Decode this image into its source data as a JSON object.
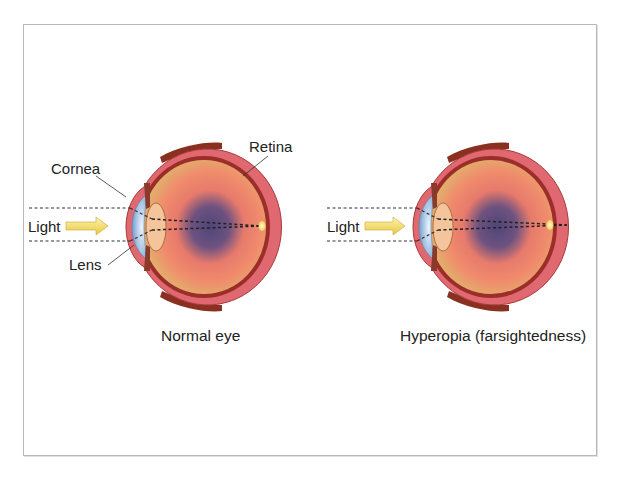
{
  "diagrams": [
    {
      "id": "normal",
      "caption": "Normal eye",
      "labels": {
        "light": "Light",
        "cornea": "Cornea",
        "lens": "Lens",
        "retina": "Retina"
      },
      "focus": "on retina"
    },
    {
      "id": "hyperopia",
      "caption": "Hyperopia (farsightedness)",
      "labels": {
        "light": "Light"
      },
      "focus": "behind retina"
    }
  ],
  "colors": {
    "sclera": "#e0606a",
    "choroid": "#9c2e2a",
    "vitreous": "#e8b070",
    "vitreous_dark": "#5a4a7a",
    "cornea": "#a8c8e8",
    "lens": "#f0c090",
    "arrow": "#f0d860",
    "focal_spot": "#ffe070",
    "frame": "#b8b8b8",
    "muscle": "#8a3020"
  }
}
